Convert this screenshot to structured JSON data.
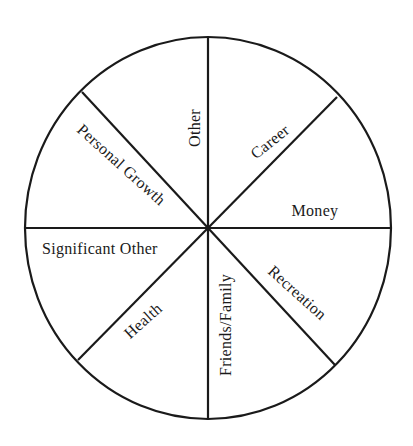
{
  "diagram": {
    "type": "wheel-of-life",
    "title": "",
    "colors": {
      "stroke": "#1a1a1a",
      "background": "#ffffff",
      "text": "#1a1a1a"
    },
    "geometry": {
      "center": [
        208,
        228
      ],
      "rx": 183,
      "ry": 191,
      "spokes": [
        {
          "name": "spoke-vertical",
          "x1": 208,
          "y1": 38,
          "x2": 208,
          "y2": 420
        },
        {
          "name": "spoke-horizontal",
          "x1": 25,
          "y1": 228,
          "x2": 391,
          "y2": 228
        },
        {
          "name": "spoke-ul-lr",
          "x1": 82,
          "y1": 92,
          "x2": 335,
          "y2": 365
        },
        {
          "name": "spoke-ur-ll",
          "x1": 337,
          "y1": 97,
          "x2": 78,
          "y2": 360
        }
      ]
    },
    "segments": [
      {
        "id": "other",
        "label": "Other",
        "cx": 195,
        "cy": 128,
        "rotate": -90
      },
      {
        "id": "career",
        "label": "Career",
        "cx": 270,
        "cy": 142,
        "rotate": -39
      },
      {
        "id": "money",
        "label": "Money",
        "cx": 315,
        "cy": 211,
        "rotate": 0
      },
      {
        "id": "recreation",
        "label": "Recreation",
        "cx": 297,
        "cy": 293,
        "rotate": 42
      },
      {
        "id": "friends-family",
        "label": "Friends/Family",
        "cx": 226,
        "cy": 325,
        "rotate": -90
      },
      {
        "id": "health",
        "label": "Health",
        "cx": 143,
        "cy": 321,
        "rotate": -42
      },
      {
        "id": "significant-other",
        "label": "Significant Other",
        "cx": 100,
        "cy": 249,
        "rotate": 0
      },
      {
        "id": "personal-growth",
        "label": "Personal Growth",
        "cx": 121,
        "cy": 165,
        "rotate": 42
      }
    ]
  }
}
